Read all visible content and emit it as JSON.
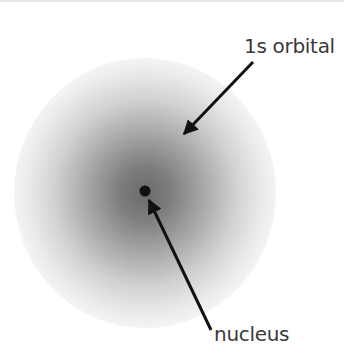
{
  "diagram": {
    "labels": {
      "orbital": "1s orbital",
      "nucleus": "nucleus"
    },
    "orbital": {
      "center": [
        145,
        193
      ],
      "radius": 133,
      "center_color": "#6e6e6e",
      "edge_color": "#f2f2f2"
    },
    "nucleus": {
      "center": [
        145,
        192
      ],
      "radius": 5,
      "color": "#111111"
    },
    "arrows": [
      {
        "name": "orbital-arrow",
        "from": [
          253,
          62
        ],
        "to": [
          182,
          136
        ]
      },
      {
        "name": "nucleus-arrow",
        "from": [
          211,
          330
        ],
        "to": [
          148,
          198
        ]
      }
    ]
  }
}
